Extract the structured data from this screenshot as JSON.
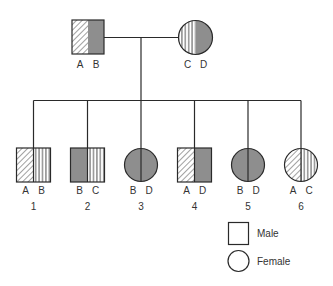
{
  "diagram": {
    "type": "pedigree",
    "colors": {
      "line": "#2a2a2a",
      "solid_fill": "#8e8e8e",
      "pattern_stroke": "#444444",
      "background": "#ffffff",
      "text": "#333333"
    },
    "allele_patterns": {
      "A": "diagonal-hatch",
      "B": "solid-gray",
      "C": "vertical-lines",
      "D": "solid-gray"
    },
    "parents": [
      {
        "id": "father",
        "sex": "male",
        "alleles": [
          "A",
          "B"
        ],
        "number": ""
      },
      {
        "id": "mother",
        "sex": "female",
        "alleles": [
          "C",
          "D"
        ],
        "number": ""
      }
    ],
    "children": [
      {
        "number": "1",
        "sex": "male",
        "alleles": [
          "A",
          "B"
        ],
        "left_pattern": "diagonal-hatch",
        "right_pattern": "vertical-lines"
      },
      {
        "number": "2",
        "sex": "male",
        "alleles": [
          "B",
          "C"
        ],
        "left_pattern": "solid-gray",
        "right_pattern": "vertical-lines"
      },
      {
        "number": "3",
        "sex": "female",
        "alleles": [
          "B",
          "D"
        ],
        "left_pattern": "solid-gray",
        "right_pattern": "solid-gray"
      },
      {
        "number": "4",
        "sex": "male",
        "alleles": [
          "A",
          "D"
        ],
        "left_pattern": "diagonal-hatch",
        "right_pattern": "solid-gray"
      },
      {
        "number": "5",
        "sex": "female",
        "alleles": [
          "B",
          "D"
        ],
        "left_pattern": "solid-gray",
        "right_pattern": "solid-gray"
      },
      {
        "number": "6",
        "sex": "female",
        "alleles": [
          "A",
          "C"
        ],
        "left_pattern": "diagonal-hatch",
        "right_pattern": "vertical-lines"
      }
    ],
    "legend": [
      {
        "symbol": "square",
        "label": "Male"
      },
      {
        "symbol": "circle",
        "label": "Female"
      }
    ]
  }
}
